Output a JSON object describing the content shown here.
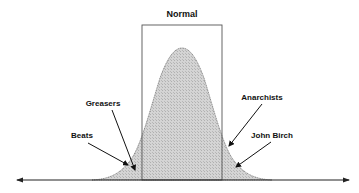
{
  "diagram": {
    "title": "Normal",
    "type": "normal-distribution-bell-curve",
    "normal_band": {
      "x_left": 142,
      "x_right": 222,
      "y_top": 25
    },
    "axis": {
      "y": 180,
      "x_start": 17,
      "x_end": 349,
      "arrows": "both"
    },
    "curve": {
      "peak_x": 182,
      "peak_y": 48,
      "left_tail_x": 92,
      "right_tail_x": 272,
      "fill": "#cfcfcf",
      "stroke": "#777777"
    },
    "labels": [
      {
        "id": "greasers",
        "text": "Greasers",
        "x": 103,
        "y": 106,
        "arrow_from": [
          112,
          110
        ],
        "arrow_to": [
          135,
          170
        ]
      },
      {
        "id": "beats",
        "text": "Beats",
        "x": 82,
        "y": 138,
        "arrow_from": [
          88,
          143
        ],
        "arrow_to": [
          128,
          165
        ]
      },
      {
        "id": "anarchists",
        "text": "Anarchists",
        "x": 262,
        "y": 100,
        "arrow_from": [
          262,
          104
        ],
        "arrow_to": [
          229,
          146
        ]
      },
      {
        "id": "john-birch",
        "text": "John Birch",
        "x": 272,
        "y": 138,
        "arrow_from": [
          271,
          142
        ],
        "arrow_to": [
          236,
          167
        ]
      }
    ]
  }
}
